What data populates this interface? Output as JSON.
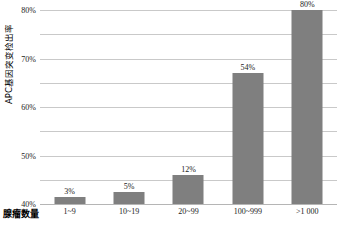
{
  "chart_data": {
    "type": "bar",
    "title": "",
    "subtitle": "",
    "xlabel": "腺瘤数量",
    "ylabel": "APC基因突变检出率",
    "categories": [
      "1~9",
      "10~19",
      "20~99",
      "100~999",
      ">1 000"
    ],
    "values": [
      3,
      5,
      12,
      54,
      80
    ],
    "value_labels": [
      "3%",
      "5%",
      "12%",
      "54%",
      "80%"
    ],
    "ylim": [
      0,
      80
    ],
    "yticks": [
      0,
      10,
      20,
      30,
      40,
      50,
      60,
      70,
      80
    ],
    "ytick_labels": [
      "0%",
      "10%",
      "20%",
      "30%",
      "40%",
      "50%",
      "60%",
      "70%",
      "80%"
    ],
    "grid": "horizontal",
    "legend": "none",
    "series": [
      {
        "name": "APC基因突变检出率",
        "values": [
          3,
          5,
          12,
          54,
          80
        ]
      }
    ],
    "colors": {
      "bar_fill": "#7f7f7f",
      "gridline": "#c9c9c9",
      "baseline": "#b5b5b5",
      "text": "#1a1a1a",
      "background": "#ffffff"
    }
  },
  "caption": {
    "text": ""
  }
}
